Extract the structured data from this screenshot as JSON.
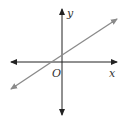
{
  "diagram": {
    "type": "coordinate-plane",
    "axes": {
      "x_label": "x",
      "y_label": "y",
      "origin_label": "O",
      "color": "#222222"
    },
    "line": {
      "color": "#8a8a8a",
      "description": "line with positive slope, positive y-intercept, negative x-intercept"
    }
  }
}
